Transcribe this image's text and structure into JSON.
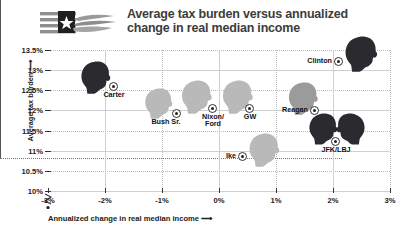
{
  "header": {
    "title_line1": "Average tax burden versus annualized",
    "title_line2": "change in real median income",
    "logo_name": "flag-hand-logo"
  },
  "axes": {
    "y_label": "Average tax burden",
    "x_label": "Annualized change in real median income",
    "y_ticks": [
      "13.5%",
      "13%",
      "12.5%",
      "12%",
      "11.5%",
      "11%",
      "10.5%",
      "10%"
    ],
    "x_ticks": [
      "-3%",
      "-2%",
      "-1%",
      "0%",
      "1%",
      "2%",
      "3%"
    ],
    "arrow": "⟶",
    "y_arrow": "⟶",
    "break_symbol": "axis-break-zigzag"
  },
  "chart_data": {
    "type": "scatter",
    "title": "Average tax burden versus annualized change in real median income",
    "xlabel": "Annualized change in real median income",
    "ylabel": "Average tax burden",
    "xlim": [
      -3,
      3
    ],
    "ylim": [
      10,
      13.5
    ],
    "xticks": [
      -3,
      -2,
      -1,
      0,
      1,
      2,
      3
    ],
    "yticks": [
      10,
      10.5,
      11,
      11.5,
      12,
      12.5,
      13,
      13.5
    ],
    "xtick_labels": [
      "-3%",
      "-2%",
      "-1%",
      "0%",
      "1%",
      "2%",
      "3%"
    ],
    "ytick_labels": [
      "10%",
      "10.5%",
      "11%",
      "11.5%",
      "12%",
      "12.5%",
      "13%",
      "13.5%"
    ],
    "grid": true,
    "legend": "none",
    "y_axis_broken_below": 10,
    "points": [
      {
        "label": "Carter",
        "x": -1.85,
        "y": 12.72,
        "tone": "dark",
        "heads": 1,
        "label_pos": "below",
        "px": 113,
        "py": 86,
        "head_px": 79,
        "head_py": 61,
        "head_w": 33,
        "head_h": 33
      },
      {
        "label": "Bush Sr.",
        "x": -0.75,
        "y": 12.22,
        "tone": "light",
        "heads": 1,
        "label_pos": "right",
        "px": 176,
        "py": 113,
        "head_px": 143,
        "head_py": 88,
        "head_w": 31,
        "head_h": 31
      },
      {
        "label": "Nixon/\nFord",
        "x": -0.12,
        "y": 12.45,
        "tone": "light",
        "heads": 1,
        "label_pos": "below",
        "px": 212,
        "py": 108,
        "head_px": 180,
        "head_py": 80,
        "head_w": 33,
        "head_h": 34
      },
      {
        "label": "GW",
        "x": 0.53,
        "y": 12.45,
        "tone": "light",
        "heads": 1,
        "label_pos": "below",
        "px": 249,
        "py": 108,
        "head_px": 221,
        "head_py": 80,
        "head_w": 33,
        "head_h": 34
      },
      {
        "label": "Ike",
        "x": 0.93,
        "y": 11.45,
        "tone": "light",
        "heads": 1,
        "label_pos": "left",
        "px": 242,
        "py": 156,
        "head_px": 248,
        "head_py": 133,
        "head_w": 32,
        "head_h": 34
      },
      {
        "label": "Reagan",
        "x": 1.78,
        "y": 12.4,
        "tone": "mid",
        "heads": 1,
        "label_pos": "left",
        "px": 314,
        "py": 110,
        "head_px": 287,
        "head_py": 82,
        "head_w": 32,
        "head_h": 33
      },
      {
        "label": "Clinton",
        "x": 2.52,
        "y": 13.18,
        "tone": "dark",
        "heads": 1,
        "label_pos": "left",
        "px": 338,
        "py": 61,
        "head_px": 344,
        "head_py": 36,
        "head_w": 34,
        "head_h": 36
      },
      {
        "label": "JFK/LBJ",
        "x": 2.18,
        "y": 11.6,
        "tone": "dark",
        "heads": 2,
        "label_pos": "below",
        "px": 335,
        "py": 141,
        "head_px": 308,
        "head_py": 113,
        "head_w": 30,
        "head_h": 32
      }
    ]
  },
  "colors": {
    "head_dark": "#2b2a2e",
    "head_mid": "#9b9b9b",
    "head_light": "#b9b9b9",
    "grid": "#cfcfcf",
    "axis": "#555555",
    "title": "#3c3c3c",
    "text": "#111111"
  }
}
